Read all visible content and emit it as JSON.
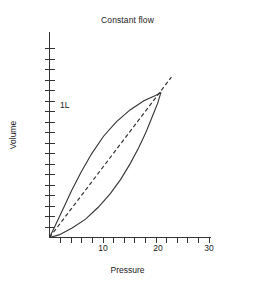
{
  "chart_data": {
    "type": "line",
    "title": "Constant flow",
    "xlabel": "Pressure",
    "ylabel": "Volume",
    "xlim": [
      0,
      30
    ],
    "ylim": [
      0,
      1.45
    ],
    "grid": false,
    "legend": "none",
    "x_ticks_major": [
      10,
      20,
      30
    ],
    "x_tick_labels": [
      "10",
      "20",
      "30"
    ],
    "x_tick_interval": 2,
    "y_tick_interval": 0.08,
    "y_ticks_labeled": [
      1
    ],
    "y_tick_labels": [
      "1L"
    ],
    "series": [
      {
        "name": "inflation-limb",
        "style": "solid",
        "points": [
          [
            0.0,
            0.0
          ],
          [
            1.2,
            0.1
          ],
          [
            2.6,
            0.22
          ],
          [
            4.2,
            0.36
          ],
          [
            6.0,
            0.5
          ],
          [
            8.0,
            0.64
          ],
          [
            10.2,
            0.77
          ],
          [
            12.6,
            0.88
          ],
          [
            15.2,
            0.97
          ],
          [
            17.8,
            1.04
          ],
          [
            20.0,
            1.08
          ],
          [
            21.0,
            1.1
          ]
        ]
      },
      {
        "name": "deflation-limb",
        "style": "solid",
        "points": [
          [
            21.0,
            1.1
          ],
          [
            20.4,
            1.02
          ],
          [
            19.4,
            0.92
          ],
          [
            18.2,
            0.8
          ],
          [
            16.8,
            0.68
          ],
          [
            15.2,
            0.56
          ],
          [
            13.4,
            0.44
          ],
          [
            11.4,
            0.33
          ],
          [
            9.2,
            0.23
          ],
          [
            6.8,
            0.14
          ],
          [
            4.2,
            0.07
          ],
          [
            1.8,
            0.02
          ],
          [
            0.0,
            0.0
          ]
        ]
      },
      {
        "name": "compliance-line",
        "style": "dashed",
        "points": [
          [
            0.0,
            0.0
          ],
          [
            23.0,
            1.22
          ]
        ]
      }
    ]
  },
  "chart": {
    "title": "Constant flow",
    "y_axis_title": "Volume",
    "x_axis_title": "Pressure",
    "y_label_1l": "1L",
    "x_label_10": "10",
    "x_label_20": "20",
    "x_label_30": "30"
  },
  "colors": {
    "ink": "#333333",
    "background": "#ffffff"
  }
}
